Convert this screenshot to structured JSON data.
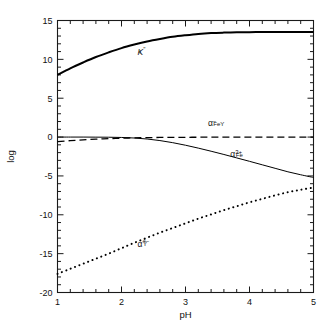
{
  "chart_data": {
    "type": "line",
    "title": "",
    "xlabel": "pH",
    "ylabel": "log",
    "xlim": [
      1,
      5
    ],
    "ylim": [
      -20,
      15
    ],
    "xticks": [
      1,
      2,
      3,
      4,
      5
    ],
    "xtick_labels": [
      "1",
      "2",
      "3",
      "4",
      "5"
    ],
    "yticks": [
      15,
      10,
      5,
      0,
      -5,
      -10,
      -15,
      -20
    ],
    "ytick_labels": [
      "15",
      "10",
      "5",
      "0",
      "-5",
      "-10",
      "-15",
      "-20"
    ],
    "minor_tick_step_x": 0.2,
    "minor_tick_step_y": 1,
    "grid": false,
    "legend_position": "inline-annotations",
    "x": [
      1.0,
      1.2,
      1.4,
      1.6,
      1.8,
      2.0,
      2.2,
      2.4,
      2.6,
      2.8,
      3.0,
      3.2,
      3.4,
      3.6,
      3.8,
      4.0,
      4.2,
      4.4,
      4.6,
      4.8,
      5.0
    ],
    "series": [
      {
        "name": "Kf''",
        "label": "K",
        "label_sub": "f",
        "label_sup": "′′",
        "style": "solid",
        "linewidth": 2.0,
        "color": "#000000",
        "label_x": 2.25,
        "label_y": 10.6,
        "values": [
          8.0,
          8.85,
          9.6,
          10.3,
          10.9,
          11.45,
          11.9,
          12.3,
          12.62,
          12.9,
          13.1,
          13.27,
          13.38,
          13.44,
          13.48,
          13.5,
          13.51,
          13.52,
          13.52,
          13.53,
          13.53
        ]
      },
      {
        "name": "alpha_FeY-",
        "label": "α",
        "label_sub": "FeY",
        "label_sup": "−",
        "style": "dashed",
        "linewidth": 1.3,
        "color": "#000000",
        "label_x": 3.35,
        "label_y": 1.45,
        "values": [
          -0.58,
          -0.46,
          -0.36,
          -0.27,
          -0.2,
          -0.14,
          -0.1,
          -0.07,
          -0.05,
          -0.04,
          -0.03,
          -0.02,
          -0.015,
          -0.01,
          -0.01,
          0.0,
          0.0,
          0.0,
          0.0,
          0.0,
          0.0
        ]
      },
      {
        "name": "alpha_Fe3+",
        "label": "α",
        "label_sub": "Fe",
        "label_sup": "3+",
        "style": "solid",
        "linewidth": 1.0,
        "color": "#000000",
        "label_x": 3.7,
        "label_y": -2.55,
        "values": [
          0.0,
          0.0,
          0.0,
          -0.01,
          -0.02,
          -0.05,
          -0.12,
          -0.25,
          -0.45,
          -0.72,
          -1.05,
          -1.42,
          -1.82,
          -2.24,
          -2.68,
          -3.12,
          -3.57,
          -4.02,
          -4.47,
          -4.85,
          -5.2
        ]
      },
      {
        "name": "alpha_Y4-",
        "label": "α",
        "label_sub": "Y",
        "label_sup": "4−",
        "style": "dotted",
        "linewidth": 2.0,
        "color": "#000000",
        "label_x": 2.25,
        "label_y": -14.1,
        "values": [
          -17.6,
          -16.95,
          -16.3,
          -15.65,
          -15.0,
          -14.3,
          -13.6,
          -12.95,
          -12.3,
          -11.7,
          -11.1,
          -10.5,
          -9.95,
          -9.4,
          -8.9,
          -8.4,
          -7.95,
          -7.5,
          -7.1,
          -6.78,
          -6.5
        ]
      }
    ]
  },
  "figure": {
    "background_color": "#ffffff",
    "axis_color": "#1a1a1a",
    "frame": "box"
  }
}
